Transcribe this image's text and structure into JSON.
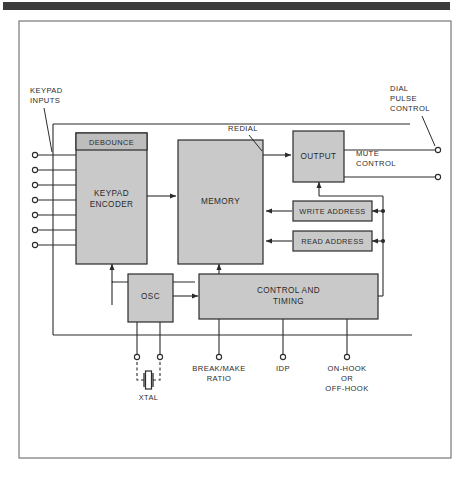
{
  "figure": {
    "type": "block-diagram",
    "top_bar_color": "#3b3b3b",
    "frame_color": "#6b6b6b",
    "block_fill": "#c9c9c9",
    "block_stroke": "#2b2b2b",
    "wire_color": "#2b2b2b",
    "background": "#ffffff"
  },
  "blocks": {
    "keypad_encoder": {
      "label_line1": "KEYPAD",
      "label_line2": "ENCODER"
    },
    "debounce": {
      "label": "DEBOUNCE"
    },
    "memory": {
      "label": "MEMORY"
    },
    "output": {
      "label": "OUTPUT"
    },
    "write_address": {
      "label": "WRITE ADDRESS"
    },
    "read_address": {
      "label": "READ ADDRESS"
    },
    "osc": {
      "label": "OSC"
    },
    "control_timing": {
      "label_line1": "CONTROL AND",
      "label_line2": "TIMING"
    }
  },
  "labels": {
    "keypad_inputs_line1": "KEYPAD",
    "keypad_inputs_line2": "INPUTS",
    "redial": "REDIAL",
    "dial_pulse_line1": "DIAL",
    "dial_pulse_line2": "PULSE",
    "dial_pulse_line3": "CONTROL",
    "mute_line1": "MUTE",
    "mute_line2": "CONTROL",
    "break_make_line1": "BREAK/MAKE",
    "break_make_line2": "RATIO",
    "idp": "IDP",
    "hook_line1": "ON-HOOK",
    "hook_line2": "OR",
    "hook_line3": "OFF-HOOK",
    "xtal": "XTAL"
  },
  "terminals": {
    "keypad_input_count": 7,
    "right_output_count": 2,
    "bottom_count": 5
  }
}
